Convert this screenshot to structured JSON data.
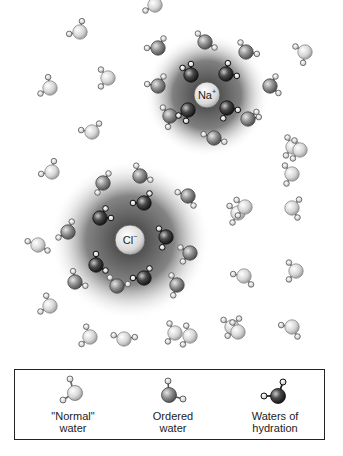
{
  "diagram": {
    "ions": [
      {
        "id": "na",
        "symbol": "Na",
        "charge": "+",
        "x": 207,
        "y": 95,
        "r": 13,
        "halo_r": 60
      },
      {
        "id": "cl",
        "symbol": "Cl",
        "charge": "−",
        "x": 130,
        "y": 240,
        "r": 15,
        "halo_r": 78
      }
    ],
    "colors": {
      "normal_water": "#d9d9d9",
      "ordered_water": "#8c8c8c",
      "hydration_water": "#3a3a3a",
      "hydrogen": "#e8e8e8",
      "halo": "#3a3a3a",
      "border": "#222222"
    }
  },
  "legend": {
    "items": [
      {
        "label_line1": "\"Normal\"",
        "label_line2": "water",
        "type": "normal"
      },
      {
        "label_line1": "Ordered",
        "label_line2": "water",
        "type": "ordered"
      },
      {
        "label_line1": "Waters of",
        "label_line2": "hydration",
        "type": "hydration"
      }
    ]
  },
  "caption": {
    "text": "...the cut-off caption text below the figure (partially visible)"
  }
}
